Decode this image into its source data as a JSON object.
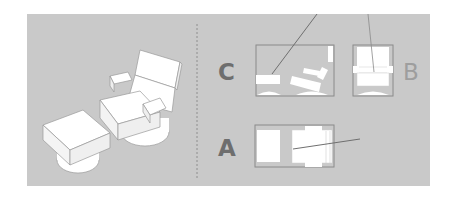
{
  "diagram": {
    "views": [
      {
        "id": "C",
        "label": "C",
        "description": "side view"
      },
      {
        "id": "B",
        "label": "B",
        "description": "front view"
      },
      {
        "id": "A",
        "label": "A",
        "description": "top view"
      }
    ],
    "colors": {
      "panel": "#c9c9c9",
      "label_dark": "#6e6e6e",
      "label_light": "#9e9e9e",
      "outline": "#8a8a8a",
      "fill": "#ffffff"
    }
  }
}
